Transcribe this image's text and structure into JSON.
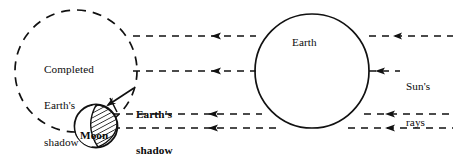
{
  "figure": {
    "title_text_blocks": {
      "completed_shadow": {
        "line1": "Completed",
        "line2": "Earth's",
        "line3": "shadow"
      },
      "moon_shadow": {
        "line1": "Earth's",
        "line2": "shadow",
        "line3": "on Moon"
      },
      "earth": "Earth",
      "moon": "Moon",
      "sun_rays": {
        "line1": "Sun's",
        "line2": "rays"
      }
    },
    "colors": {
      "stroke": "#111111",
      "background": "#ffffff",
      "hatch": "#111111"
    },
    "geometry": {
      "umbra_circle": {
        "cx": 76,
        "cy": 71,
        "r": 61,
        "style": "dashed"
      },
      "earth_circle": {
        "cx": 312,
        "cy": 71,
        "r": 57,
        "style": "solid"
      },
      "moon_circle": {
        "cx": 96,
        "cy": 126,
        "r": 22,
        "style": "solid"
      },
      "ray_y_positions": [
        36,
        71,
        114,
        128
      ],
      "ray_direction": "right-to-left",
      "ray_style": "dashed-with-arrowhead"
    },
    "elements": {
      "umbra_name": "completed-earth-shadow-region",
      "moon_shadow_name": "earth-shadow-on-moon-hatched-region",
      "pointer_name": "shadow-pointer-arrow"
    }
  }
}
